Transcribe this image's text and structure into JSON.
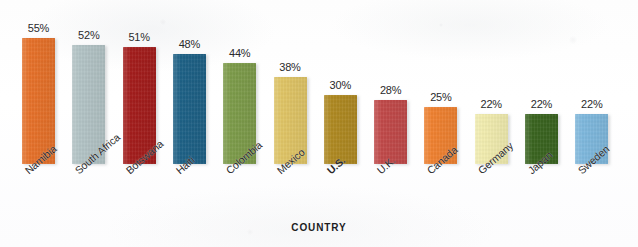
{
  "chart_data": {
    "type": "bar",
    "title": "",
    "subtitle": "",
    "xlabel": "COUNTRY",
    "ylabel": "",
    "ylim": [
      0,
      60
    ],
    "grid": false,
    "legend": "none",
    "value_suffix": "%",
    "categories": [
      "Namibia",
      "South Africa",
      "Botswana",
      "Haiti",
      "Colombia",
      "Mexico",
      "U.S.",
      "U.K.",
      "Canada",
      "Germany",
      "Japan",
      "Sweden"
    ],
    "values": [
      55,
      52,
      51,
      48,
      44,
      38,
      30,
      28,
      25,
      22,
      22,
      22
    ],
    "value_labels": [
      "55%",
      "52%",
      "51%",
      "48%",
      "44%",
      "38%",
      "30%",
      "28%",
      "25%",
      "22%",
      "22%",
      "22%"
    ],
    "bar_colors": [
      "#E8722A",
      "#B4C5C7",
      "#A51D1C",
      "#1E6287",
      "#7E9D4B",
      "#E1C667",
      "#B08A22",
      "#C24A4A",
      "#F18231",
      "#F3EEB0",
      "#3A6520",
      "#7FB9DE"
    ],
    "emphasis_category": "U.S.",
    "bars": [
      {
        "label": "Namibia",
        "value": 55,
        "value_label": "55%",
        "color": "#E8722A",
        "emphasis": false
      },
      {
        "label": "South Africa",
        "value": 52,
        "value_label": "52%",
        "color": "#B4C5C7",
        "emphasis": false
      },
      {
        "label": "Botswana",
        "value": 51,
        "value_label": "51%",
        "color": "#A51D1C",
        "emphasis": false
      },
      {
        "label": "Haiti",
        "value": 48,
        "value_label": "48%",
        "color": "#1E6287",
        "emphasis": false
      },
      {
        "label": "Colombia",
        "value": 44,
        "value_label": "44%",
        "color": "#7E9D4B",
        "emphasis": false
      },
      {
        "label": "Mexico",
        "value": 38,
        "value_label": "38%",
        "color": "#E1C667",
        "emphasis": false
      },
      {
        "label": "U.S.",
        "value": 30,
        "value_label": "30%",
        "color": "#B08A22",
        "emphasis": true
      },
      {
        "label": "U.K.",
        "value": 28,
        "value_label": "28%",
        "color": "#C24A4A",
        "emphasis": false
      },
      {
        "label": "Canada",
        "value": 25,
        "value_label": "25%",
        "color": "#F18231",
        "emphasis": false
      },
      {
        "label": "Germany",
        "value": 22,
        "value_label": "22%",
        "color": "#F3EEB0",
        "emphasis": false
      },
      {
        "label": "Japan",
        "value": 22,
        "value_label": "22%",
        "color": "#3A6520",
        "emphasis": false
      },
      {
        "label": "Sweden",
        "value": 22,
        "value_label": "22%",
        "color": "#7FB9DE",
        "emphasis": false
      }
    ]
  },
  "layout": {
    "first_bar_left": 22,
    "bar_pitch": 50.3,
    "bar_width": 33,
    "px_per_percent": 2.29
  }
}
